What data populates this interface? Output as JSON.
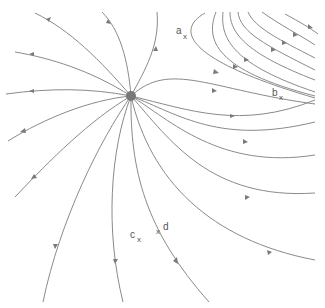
{
  "diagram": {
    "type": "vector-field-streamlines",
    "clipped_title_fragment": "",
    "source_node": {
      "name": "source-point",
      "cx": 131,
      "cy": 96,
      "r": 5,
      "color": "#777777"
    },
    "colors": {
      "stream": "#8a8a8a",
      "arrow": "#7a7a7a",
      "label": "#555555"
    },
    "points": [
      {
        "label": "a",
        "marker": "x",
        "x": 182,
        "y": 35
      },
      {
        "label": "b",
        "marker": "x",
        "x": 277,
        "y": 96
      },
      {
        "label": "c",
        "marker": "x",
        "x": 137,
        "y": 238
      },
      {
        "label": "d",
        "marker": "x",
        "x": 158,
        "y": 231
      }
    ]
  }
}
